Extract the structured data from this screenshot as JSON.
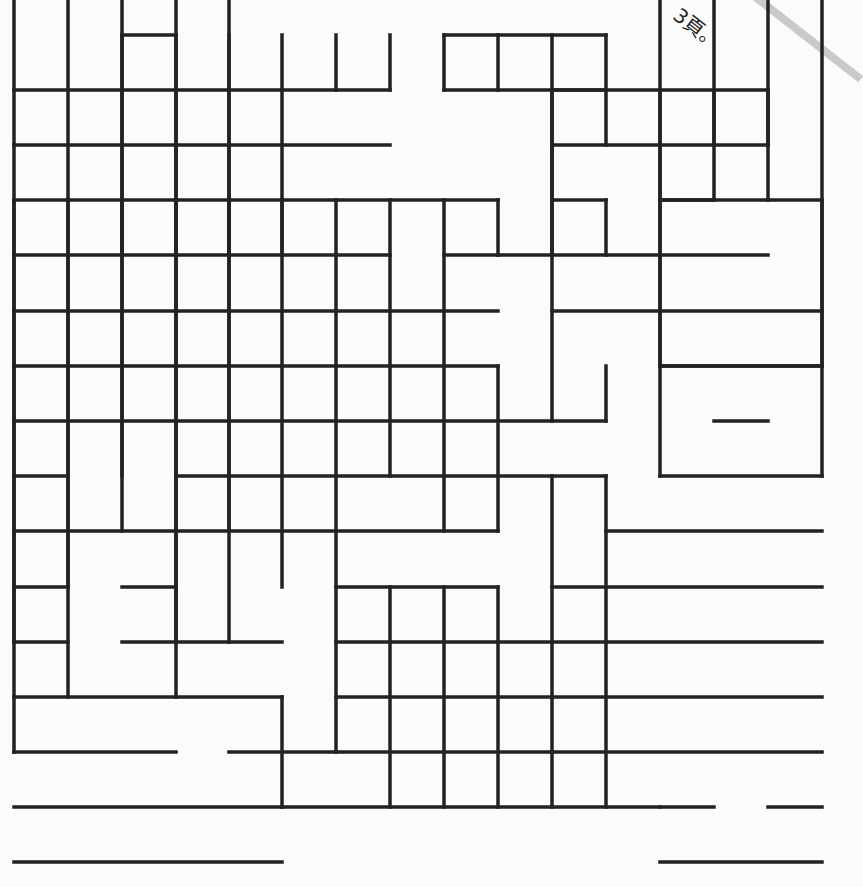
{
  "page": {
    "note_text": "3頁。",
    "background_color": "#fbfbf9",
    "line_color": "#222222",
    "fold_color": "#c9c9c9"
  },
  "maze": {
    "description": "Irregular grid puzzle made of square cells with some internal walls removed",
    "cols_x": [
      14,
      68,
      122,
      176,
      229,
      282,
      336,
      390,
      444,
      498,
      552,
      606,
      660,
      714,
      768,
      822
    ],
    "rows_y": [
      35,
      90,
      145,
      200,
      255,
      311,
      366,
      421,
      476,
      531,
      587,
      642,
      697,
      752,
      807,
      862
    ],
    "stroke_width": 3.5,
    "h_segments": [
      [
        2,
        3,
        0
      ],
      [
        0,
        7,
        1
      ],
      [
        0,
        7,
        2
      ],
      [
        0,
        9,
        3
      ],
      [
        0,
        7,
        4
      ],
      [
        8,
        9,
        4
      ],
      [
        9,
        14,
        4
      ],
      [
        0,
        9,
        5
      ],
      [
        10,
        12,
        5
      ],
      [
        12,
        15,
        5
      ],
      [
        0,
        9,
        6
      ],
      [
        12,
        15,
        6
      ],
      [
        0,
        11,
        7
      ],
      [
        13,
        14,
        7
      ],
      [
        0,
        1,
        8
      ],
      [
        3,
        11,
        8
      ],
      [
        12,
        15,
        8
      ],
      [
        0,
        9,
        9
      ],
      [
        11,
        15,
        9
      ],
      [
        0,
        1,
        10
      ],
      [
        2,
        3,
        10
      ],
      [
        6,
        9,
        10
      ],
      [
        10,
        15,
        10
      ],
      [
        0,
        1,
        11
      ],
      [
        2,
        5,
        11
      ],
      [
        6,
        15,
        11
      ],
      [
        0,
        5,
        12
      ],
      [
        6,
        15,
        12
      ],
      [
        0,
        3,
        13
      ],
      [
        4,
        15,
        13
      ],
      [
        0,
        5,
        14
      ],
      [
        5,
        12,
        14
      ],
      [
        12,
        13,
        14
      ],
      [
        14,
        15,
        14
      ],
      [
        0,
        5,
        15
      ],
      [
        12,
        15,
        15
      ],
      [
        8,
        11,
        0
      ],
      [
        8,
        11,
        1
      ],
      [
        10,
        14,
        1
      ],
      [
        10,
        14,
        2
      ],
      [
        10,
        11,
        3
      ],
      [
        12,
        13,
        3
      ],
      [
        12,
        15,
        3
      ],
      [
        12,
        15,
        6
      ]
    ],
    "v_segments": [
      [
        0,
        1,
        2
      ],
      [
        3,
        4,
        2
      ],
      [
        0,
        1,
        3
      ],
      [
        3,
        4,
        3
      ],
      [
        0,
        1,
        4
      ],
      [
        3,
        4,
        4
      ],
      [
        0,
        1,
        5
      ],
      [
        3,
        4,
        5
      ],
      [
        0,
        1,
        6
      ],
      [
        0,
        1,
        7
      ],
      [
        1,
        4,
        2
      ],
      [
        1,
        4,
        3
      ],
      [
        1,
        4,
        4
      ],
      [
        1,
        3,
        5
      ],
      [
        3,
        11,
        0
      ],
      [
        13,
        16,
        0
      ],
      [
        3,
        10,
        1
      ],
      [
        12,
        16,
        1
      ],
      [
        3,
        8,
        2
      ],
      [
        9,
        16,
        2
      ],
      [
        3,
        8,
        3
      ],
      [
        8,
        11,
        3
      ],
      [
        12,
        16,
        3
      ],
      [
        3,
        9,
        4
      ],
      [
        11,
        16,
        4
      ],
      [
        3,
        10,
        5
      ],
      [
        12,
        14,
        5
      ],
      [
        3,
        13,
        6
      ],
      [
        3,
        8,
        7
      ],
      [
        10,
        14,
        7
      ],
      [
        3,
        9,
        8
      ],
      [
        10,
        14,
        8
      ],
      [
        3,
        4,
        9
      ],
      [
        6,
        9,
        9
      ],
      [
        10,
        14,
        9
      ],
      [
        0,
        1,
        8
      ],
      [
        0,
        1,
        9
      ],
      [
        0,
        4,
        10
      ],
      [
        0,
        1,
        11
      ],
      [
        1,
        7,
        10
      ],
      [
        8,
        14,
        10
      ],
      [
        1,
        2,
        11
      ],
      [
        3,
        4,
        11
      ],
      [
        6,
        7,
        11
      ],
      [
        8,
        14,
        11
      ],
      [
        1,
        3,
        12
      ],
      [
        3,
        6,
        12
      ],
      [
        8,
        16,
        12
      ],
      [
        1,
        2,
        13
      ],
      [
        3,
        16,
        13
      ],
      [
        1,
        2,
        14
      ],
      [
        3,
        16,
        14
      ],
      [
        3,
        6,
        15
      ],
      [
        8,
        16,
        15
      ]
    ]
  }
}
